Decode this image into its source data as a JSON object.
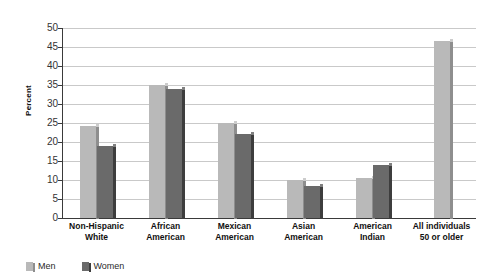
{
  "chart_data": {
    "type": "bar",
    "title": "",
    "xlabel": "",
    "ylabel": "Percent",
    "ylim": [
      0,
      50
    ],
    "ytick_step": 5,
    "yticks": [
      "0",
      "5",
      "10",
      "15",
      "20",
      "25",
      "30",
      "35",
      "40",
      "45",
      "50"
    ],
    "grid": true,
    "legend_position": "bottom-left",
    "categories": [
      "Non-Hispanic White",
      "African American",
      "Mexican American",
      "Asian American",
      "American Indian",
      "All individuals 50 or older"
    ],
    "category_lines": [
      [
        "Non-Hispanic",
        "White"
      ],
      [
        "African",
        "American"
      ],
      [
        "Mexican",
        "American"
      ],
      [
        "Asian",
        "American"
      ],
      [
        "American",
        "Indian"
      ],
      [
        "All individuals",
        "50 or older"
      ]
    ],
    "series": [
      {
        "name": "Men",
        "color": "#b9b9b9",
        "values": [
          24.3,
          35,
          25,
          10,
          10.5,
          46.5
        ]
      },
      {
        "name": "Women",
        "color": "#6a6a6a",
        "values": [
          19,
          34,
          22,
          8.5,
          14,
          null
        ]
      }
    ]
  },
  "legend": {
    "items": [
      {
        "label": "Men",
        "swatch": "men"
      },
      {
        "label": "Women",
        "swatch": "women"
      }
    ]
  },
  "axis": {
    "y_title": "Percent"
  }
}
